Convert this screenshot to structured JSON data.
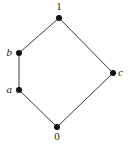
{
  "diagram": {
    "type": "hasse-diagram",
    "nodes": [
      {
        "id": "top",
        "label": "1",
        "x": 59,
        "y": 18,
        "lx": 59,
        "ly": 10,
        "anchor": "middle",
        "italic": false
      },
      {
        "id": "b",
        "label": "b",
        "x": 19,
        "y": 53,
        "lx": 12,
        "ly": 56,
        "anchor": "end",
        "italic": true
      },
      {
        "id": "a",
        "label": "a",
        "x": 19,
        "y": 90,
        "lx": 12,
        "ly": 93,
        "anchor": "end",
        "italic": true
      },
      {
        "id": "c",
        "label": "c",
        "x": 113,
        "y": 73,
        "lx": 118,
        "ly": 76,
        "anchor": "start",
        "italic": true
      },
      {
        "id": "bottom",
        "label": "0",
        "x": 57,
        "y": 127,
        "lx": 57,
        "ly": 140,
        "anchor": "middle",
        "italic": false
      }
    ],
    "edges": [
      {
        "from": "bottom",
        "to": "a"
      },
      {
        "from": "a",
        "to": "b"
      },
      {
        "from": "b",
        "to": "top"
      },
      {
        "from": "bottom",
        "to": "c"
      },
      {
        "from": "c",
        "to": "top"
      }
    ]
  }
}
